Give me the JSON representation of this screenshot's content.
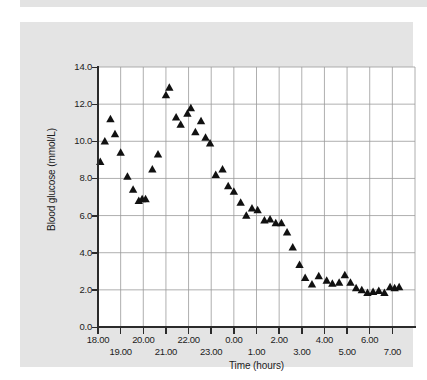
{
  "chart_data": {
    "type": "scatter",
    "title": "",
    "xlabel": "Time (hours)",
    "ylabel": "Blood glucose (mmol/L)",
    "xlim": [
      18,
      32
    ],
    "ylim": [
      0.0,
      14.0
    ],
    "grid": true,
    "legend": null,
    "marker": "triangle",
    "marker_color": "#111111",
    "y_ticks": [
      "14.0",
      "12.0",
      "10.0",
      "8.0",
      "6.0",
      "4.0",
      "2.0",
      "0.0"
    ],
    "y_tick_values": [
      14.0,
      12.0,
      10.0,
      8.0,
      6.0,
      4.0,
      2.0,
      0.0
    ],
    "x_ticks": [
      "18.00",
      "19.00",
      "20.00",
      "21.00",
      "22.00",
      "23.00",
      "0.00",
      "1.00",
      "2.00",
      "3.00",
      "4.00",
      "5.00",
      "6.00",
      "7.00"
    ],
    "x_tick_values": [
      18,
      19,
      20,
      21,
      22,
      23,
      24,
      25,
      26,
      27,
      28,
      29,
      30,
      31
    ],
    "x_tick_rows": [
      "top",
      "bot",
      "top",
      "bot",
      "top",
      "bot",
      "top",
      "bot",
      "top",
      "bot",
      "top",
      "bot",
      "top",
      "bot"
    ],
    "x": [
      18.1,
      18.3,
      18.55,
      18.75,
      19.0,
      19.3,
      19.55,
      19.8,
      19.95,
      20.1,
      20.4,
      20.65,
      21.0,
      21.15,
      21.45,
      21.65,
      21.95,
      22.1,
      22.3,
      22.55,
      22.75,
      22.95,
      23.2,
      23.5,
      23.75,
      24.0,
      24.3,
      24.55,
      24.8,
      25.05,
      25.35,
      25.6,
      25.85,
      26.1,
      26.35,
      26.6,
      26.9,
      27.15,
      27.45,
      27.75,
      28.1,
      28.35,
      28.65,
      28.9,
      29.15,
      29.4,
      29.65,
      29.9,
      30.15,
      30.4,
      30.65,
      30.9,
      31.1,
      31.3
    ],
    "y": [
      8.9,
      10.0,
      11.2,
      10.4,
      9.4,
      8.1,
      7.4,
      6.8,
      6.9,
      6.9,
      8.5,
      9.3,
      12.5,
      12.9,
      11.3,
      10.9,
      11.5,
      11.8,
      10.5,
      11.1,
      10.2,
      9.9,
      8.2,
      8.5,
      7.6,
      7.3,
      6.7,
      6.0,
      6.4,
      6.3,
      5.75,
      5.8,
      5.6,
      5.6,
      5.1,
      4.3,
      3.35,
      2.65,
      2.3,
      2.75,
      2.5,
      2.35,
      2.4,
      2.8,
      2.4,
      2.1,
      2.0,
      1.85,
      1.9,
      1.95,
      1.85,
      2.15,
      2.1,
      2.15
    ]
  }
}
